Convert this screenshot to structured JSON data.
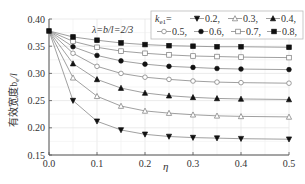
{
  "chart_data": {
    "type": "line",
    "title": "",
    "annotation": "λ=b/l=2/3",
    "xlabel": "η",
    "ylabel": "有效宽度b_e/l",
    "xlim": [
      0.0,
      0.5
    ],
    "ylim": [
      0.15,
      0.4
    ],
    "xticks": [
      "0.0",
      "0.1",
      "0.2",
      "0.3",
      "0.4",
      "0.5"
    ],
    "yticks": [
      "0.15",
      "0.20",
      "0.25",
      "0.30",
      "0.35",
      "0.40"
    ],
    "grid": true,
    "legend_title": "k_e1=",
    "legend_position": "upper right",
    "x": [
      0,
      0.05,
      0.1,
      0.15,
      0.2,
      0.25,
      0.3,
      0.35,
      0.4,
      0.5
    ],
    "series": [
      {
        "name": "0.2",
        "marker": "triangle-down-filled",
        "values": [
          0.378,
          0.25,
          0.212,
          0.196,
          0.188,
          0.184,
          0.182,
          0.181,
          0.18,
          0.179
        ]
      },
      {
        "name": "0.3",
        "marker": "triangle-up-open",
        "values": [
          0.378,
          0.292,
          0.258,
          0.24,
          0.231,
          0.227,
          0.224,
          0.222,
          0.221,
          0.22
        ]
      },
      {
        "name": "0.4",
        "marker": "triangle-up-filled",
        "values": [
          0.378,
          0.318,
          0.289,
          0.273,
          0.264,
          0.259,
          0.256,
          0.254,
          0.253,
          0.252
        ]
      },
      {
        "name": "0.5",
        "marker": "circle-open",
        "values": [
          0.378,
          0.337,
          0.313,
          0.3,
          0.293,
          0.289,
          0.286,
          0.284,
          0.283,
          0.282
        ]
      },
      {
        "name": "0.6",
        "marker": "circle-filled",
        "values": [
          0.378,
          0.349,
          0.333,
          0.323,
          0.317,
          0.313,
          0.311,
          0.309,
          0.308,
          0.307
        ]
      },
      {
        "name": "0.7",
        "marker": "square-open",
        "values": [
          0.378,
          0.359,
          0.348,
          0.341,
          0.337,
          0.334,
          0.332,
          0.331,
          0.33,
          0.329
        ]
      },
      {
        "name": "0.8",
        "marker": "square-filled",
        "values": [
          0.378,
          0.367,
          0.361,
          0.356,
          0.353,
          0.351,
          0.35,
          0.349,
          0.349,
          0.348
        ]
      }
    ]
  },
  "labels": {
    "annotation": "λ=b/l=2/3",
    "xlabel": "η",
    "ylabel": "有效宽度b",
    "ylabel_sub": "e",
    "ylabel_tail": "/l",
    "legend_k": "k",
    "legend_k_sub": "e1",
    "legend_eq": "=",
    "legend_row1": [
      "0.2,",
      "0.3,",
      "0.4,"
    ],
    "legend_row2": [
      "0.5,",
      "0.6,",
      "0.7,",
      "0.8,"
    ]
  }
}
